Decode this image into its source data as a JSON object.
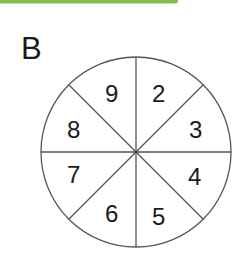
{
  "header": {
    "bar_color": "#7fbf4d"
  },
  "figure": {
    "label": "B",
    "spinner": {
      "sections": 8,
      "numbers": [
        {
          "value": "2",
          "position": "top-right"
        },
        {
          "value": "3",
          "position": "right-top"
        },
        {
          "value": "4",
          "position": "right-bottom"
        },
        {
          "value": "5",
          "position": "bottom-right"
        },
        {
          "value": "6",
          "position": "bottom-left"
        },
        {
          "value": "7",
          "position": "left-bottom"
        },
        {
          "value": "8",
          "position": "left-top"
        },
        {
          "value": "9",
          "position": "top-left"
        }
      ],
      "line_color": "#555555"
    }
  }
}
